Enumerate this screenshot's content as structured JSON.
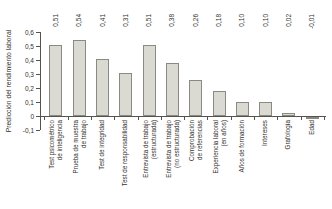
{
  "chart_data": {
    "type": "bar",
    "title": "",
    "xlabel": "",
    "ylabel": "Predicción del rendimiento laboral",
    "ylim": [
      -0.1,
      0.6
    ],
    "ytick_step": 0.1,
    "ytick_labels": [
      "0,6",
      "0,5",
      "0,4",
      "0,3",
      "0,2",
      "0,1",
      "0",
      "-0,1"
    ],
    "grid": false,
    "legend": null,
    "categories": [
      [
        "Test psicométrico",
        "de inteligencia"
      ],
      [
        "Prueba de muestra",
        "de trabajo"
      ],
      [
        "Test de integridad"
      ],
      [
        "Test de responsabilidad"
      ],
      [
        "Entrevista de trabajo",
        "(estructurada)"
      ],
      [
        "Entrevista de trabajo",
        "(no estructurada)"
      ],
      [
        "Comprobación",
        "de referencias"
      ],
      [
        "Experiencia laboral",
        "(en años)"
      ],
      [
        "Años de formación"
      ],
      [
        "Intereses"
      ],
      [
        "Grafología"
      ],
      [
        "Edad"
      ]
    ],
    "values": [
      0.51,
      0.54,
      0.41,
      0.31,
      0.51,
      0.38,
      0.26,
      0.18,
      0.1,
      0.1,
      0.02,
      -0.01
    ],
    "value_labels": [
      "0,51",
      "0,54",
      "0,41",
      "0,31",
      "0,51",
      "0,38",
      "0,26",
      "0,18",
      "0,10",
      "0,10",
      "0,02",
      "-0,01"
    ],
    "colors": {
      "bar_fill": "#dadad2",
      "bar_border": "#8b8a82",
      "axis": "#55544c",
      "text": "#33322c",
      "background": "#ffffff"
    }
  }
}
